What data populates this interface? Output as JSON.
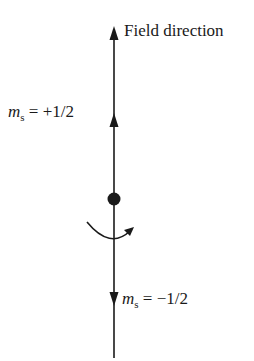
{
  "diagram": {
    "field_label": "Field direction",
    "spin_up": {
      "symbol": "m",
      "subscript": "s",
      "equals": " = ",
      "value": "+1/2"
    },
    "spin_down": {
      "symbol": "m",
      "subscript": "s",
      "equals": " = ",
      "value": "−1/2"
    },
    "colors": {
      "line": "#1a1a1a",
      "background": "#ffffff"
    }
  }
}
